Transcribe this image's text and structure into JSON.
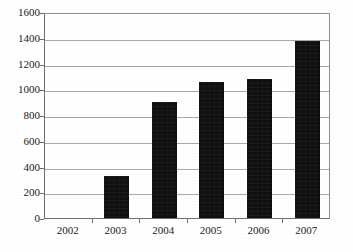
{
  "chart_data": {
    "type": "bar",
    "title": "",
    "subtitle": "",
    "xlabel": "",
    "ylabel": "",
    "categories": [
      "2002",
      "2003",
      "2004",
      "2005",
      "2006",
      "2007"
    ],
    "values": [
      0,
      325,
      900,
      1055,
      1080,
      1375
    ],
    "ylim": [
      0,
      1600
    ],
    "y_ticks": [
      0,
      200,
      400,
      600,
      800,
      1000,
      1200,
      1400,
      1600
    ],
    "y_tick_labels": [
      "0",
      "200",
      "400",
      "600",
      "800",
      "1000",
      "1200",
      "1400",
      "1600"
    ],
    "grid": true,
    "grid_axis": "y",
    "legend": false,
    "legend_position": "none",
    "annotations": [],
    "series": [
      {
        "name": "",
        "values": [
          0,
          325,
          900,
          1055,
          1080,
          1375
        ]
      }
    ],
    "colors": {
      "bar_fill": "#101010",
      "gridline": "#a8a8a8",
      "axis_line": "#6f6f6f",
      "plot_border": "#8f8f8f",
      "background": "#ffffff",
      "tick_label": "#1a1a1a"
    }
  }
}
